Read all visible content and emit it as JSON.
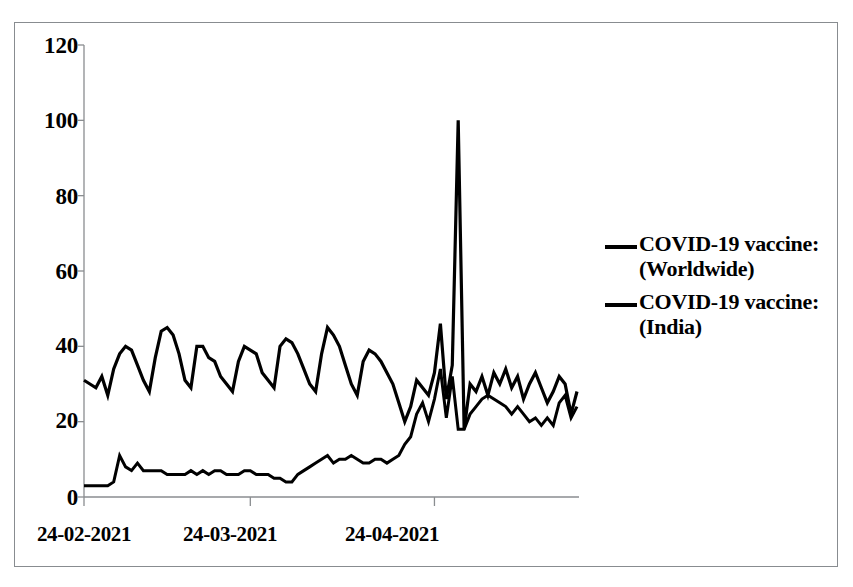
{
  "chart_data": {
    "type": "line",
    "title": "",
    "subtitle": "",
    "xlabel": "",
    "ylabel": "",
    "ylim": [
      0,
      120
    ],
    "yticks": [
      0,
      20,
      40,
      60,
      80,
      100,
      120
    ],
    "ytick_labels": [
      "0",
      "20",
      "40",
      "60",
      "80",
      "100",
      "120"
    ],
    "xtick_labels": [
      "24-02-2021",
      "24-03-2021",
      "24-04-2021"
    ],
    "xtick_index": [
      0,
      28,
      59
    ],
    "grid": false,
    "legend_position": "right",
    "line_color": "#000000",
    "series": [
      {
        "name": "COVID-19 vaccine: (Worldwide)",
        "label_line1": "COVID-19 vaccine:",
        "label_line2": "(Worldwide)",
        "color": "#000000",
        "values": [
          31,
          30,
          29,
          32,
          27,
          34,
          38,
          40,
          39,
          35,
          31,
          28,
          37,
          44,
          45,
          43,
          38,
          31,
          29,
          40,
          40,
          37,
          36,
          32,
          30,
          28,
          36,
          40,
          39,
          38,
          33,
          31,
          29,
          40,
          42,
          41,
          38,
          34,
          30,
          28,
          38,
          45,
          43,
          40,
          35,
          30,
          27,
          36,
          39,
          38,
          36,
          33,
          30,
          25,
          20,
          24,
          31,
          29,
          27,
          33,
          46,
          26,
          35,
          100,
          18,
          30,
          28,
          32,
          27,
          33,
          30,
          34,
          29,
          32,
          26,
          30,
          33,
          29,
          25,
          28,
          32,
          30,
          22,
          28
        ]
      },
      {
        "name": "COVID-19 vaccine: (India)",
        "label_line1": "COVID-19 vaccine:",
        "label_line2": "(India)",
        "color": "#000000",
        "values": [
          3,
          3,
          3,
          3,
          3,
          4,
          11,
          8,
          7,
          9,
          7,
          7,
          7,
          7,
          6,
          6,
          6,
          6,
          7,
          6,
          7,
          6,
          7,
          7,
          6,
          6,
          6,
          7,
          7,
          6,
          6,
          6,
          5,
          5,
          4,
          4,
          6,
          7,
          8,
          9,
          10,
          11,
          9,
          10,
          10,
          11,
          10,
          9,
          9,
          10,
          10,
          9,
          10,
          11,
          14,
          16,
          22,
          25,
          20,
          26,
          34,
          21,
          32,
          18,
          18,
          22,
          24,
          26,
          27,
          26,
          25,
          24,
          22,
          24,
          22,
          20,
          21,
          19,
          21,
          19,
          25,
          27,
          21,
          24
        ]
      }
    ]
  },
  "axis": {
    "y_tick_positions_px": [
      45,
      120,
      196,
      271,
      345,
      420,
      497
    ],
    "x_tick_positions_px": [
      84,
      230,
      392
    ]
  }
}
